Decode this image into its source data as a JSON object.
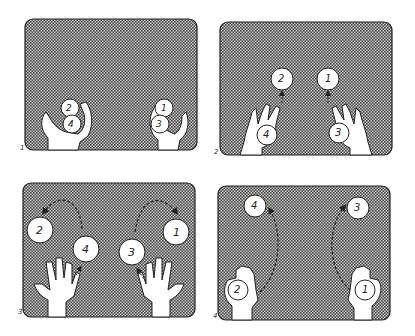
{
  "panels": [
    {
      "number": "1",
      "balls": [
        {
          "label": "2",
          "x": 70,
          "y": 110
        },
        {
          "label": "4",
          "x": 73,
          "y": 125
        },
        {
          "label": "1",
          "x": 163,
          "y": 110
        },
        {
          "label": "3",
          "x": 160,
          "y": 125
        }
      ]
    },
    {
      "number": "2",
      "balls": [
        {
          "label": "2",
          "x": 282,
          "y": 80
        },
        {
          "label": "1",
          "x": 328,
          "y": 80
        },
        {
          "label": "4",
          "x": 268,
          "y": 135
        },
        {
          "label": "3",
          "x": 340,
          "y": 133
        }
      ]
    },
    {
      "number": "3",
      "balls": [
        {
          "label": "2",
          "x": 40,
          "y": 230
        },
        {
          "label": "4",
          "x": 88,
          "y": 249
        },
        {
          "label": "3",
          "x": 134,
          "y": 252
        },
        {
          "label": "1",
          "x": 178,
          "y": 232
        }
      ]
    },
    {
      "number": "4",
      "balls": [
        {
          "label": "4",
          "x": 255,
          "y": 206
        },
        {
          "label": "3",
          "x": 358,
          "y": 208
        },
        {
          "label": "2",
          "x": 237,
          "y": 290
        },
        {
          "label": "1",
          "x": 366,
          "y": 290
        }
      ]
    }
  ],
  "colors": {
    "pattern_dark": "#555555",
    "pattern_light": "#bdbdbd",
    "outline": "#222222",
    "fill": "#ffffff"
  }
}
